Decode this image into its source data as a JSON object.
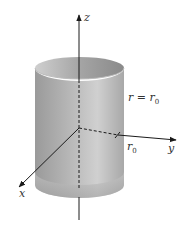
{
  "figure": {
    "type": "3d-cylinder-diagram",
    "colors": {
      "background": "#ffffff",
      "cylinder_light": "#d4d4d4",
      "cylinder_dark": "#8f8f8f",
      "axis": "#1a1a1a",
      "text": "#333333"
    }
  },
  "axes": {
    "z_label": "z",
    "y_label": "y",
    "x_label": "x"
  },
  "labels": {
    "surface_equation": "r = r",
    "surface_equation_sub": "0",
    "radius": "r",
    "radius_sub": "0"
  }
}
